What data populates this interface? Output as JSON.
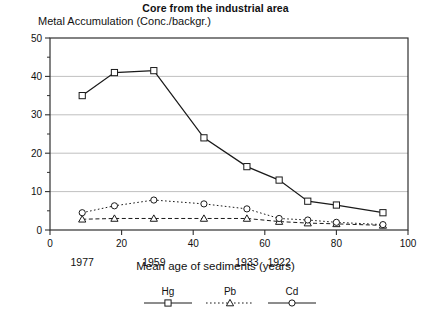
{
  "title": "Core from the industrial area",
  "subtitle": "Metal Accumulation (Conc./backgr.)",
  "xlabel": "Mean age of sediments (years)",
  "colors": {
    "ink": "#1a1a1a",
    "grid": "#b9b9b9",
    "frame": "#303030"
  },
  "chart_data": {
    "type": "line",
    "title": "Core from the industrial area",
    "subtitle": "Metal Accumulation (Conc./backgr.)",
    "xlabel": "Mean age of sediments (years)",
    "ylabel": "Metal Accumulation (Conc./backgr.)",
    "xlim": [
      0,
      100
    ],
    "ylim": [
      0,
      50
    ],
    "xticks": [
      0,
      20,
      40,
      60,
      80,
      100
    ],
    "yticks": [
      0,
      10,
      20,
      30,
      40,
      50
    ],
    "yminorticks": [
      5,
      15,
      25,
      35,
      45
    ],
    "grid": "horizontal",
    "legend_position": "bottom",
    "secondary_x_labels": [
      {
        "x": 9,
        "label": "1977"
      },
      {
        "x": 29,
        "label": "1959"
      },
      {
        "x": 55,
        "label": "1933"
      },
      {
        "x": 64,
        "label": "1922"
      }
    ],
    "series": [
      {
        "name": "Hg",
        "marker": "square",
        "linestyle": "solid",
        "x": [
          9,
          18,
          29,
          43,
          55,
          64,
          72,
          80,
          93
        ],
        "values": [
          35,
          41,
          41.5,
          24,
          16.5,
          13,
          7.5,
          6.5,
          4.5
        ]
      },
      {
        "name": "Pb",
        "marker": "triangle",
        "linestyle": "dashed",
        "x": [
          9,
          18,
          29,
          43,
          55,
          64,
          72,
          80,
          93
        ],
        "values": [
          2.8,
          3.0,
          3.0,
          3.0,
          3.0,
          2.2,
          1.8,
          1.6,
          1.2
        ]
      },
      {
        "name": "Cd",
        "marker": "circle",
        "linestyle": "dotted",
        "x": [
          9,
          18,
          29,
          43,
          55,
          64,
          72,
          80,
          93
        ],
        "values": [
          4.5,
          6.3,
          7.8,
          6.8,
          5.5,
          3.0,
          2.6,
          2.0,
          1.4
        ]
      }
    ]
  },
  "legend": [
    {
      "label": "Hg",
      "marker": "square",
      "linestyle": "solid"
    },
    {
      "label": "Pb",
      "marker": "triangle",
      "linestyle": "dotted"
    },
    {
      "label": "Cd",
      "marker": "circle",
      "linestyle": "solid"
    }
  ]
}
